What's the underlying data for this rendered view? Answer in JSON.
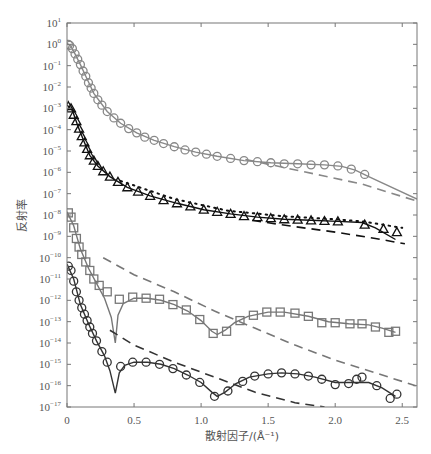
{
  "chart_data": {
    "type": "scatter",
    "title": "",
    "xlabel": "散射因子/(Å⁻¹)",
    "ylabel": "反射率",
    "xlim": [
      0,
      2.61
    ],
    "ylim_log10": [
      -17,
      1
    ],
    "yscale": "log",
    "grid": false,
    "legend": null,
    "x_ticks": [
      0,
      0.5,
      1.0,
      1.5,
      2.0,
      2.5
    ],
    "x_tick_labels": [
      "0",
      "0.5",
      "1.0",
      "1.5",
      "2.0",
      "2.5"
    ],
    "y_ticks_log10": [
      1,
      0,
      -1,
      -2,
      -3,
      -4,
      -5,
      -6,
      -7,
      -8,
      -9,
      -10,
      -11,
      -12,
      -13,
      -14,
      -15,
      -16,
      -17
    ],
    "series": [
      {
        "name": "gray-circles-top",
        "marker": "circle",
        "color": "#888888",
        "points_log10": [
          [
            0.01,
            0.0
          ],
          [
            0.02,
            -0.05
          ],
          [
            0.04,
            -0.2
          ],
          [
            0.06,
            -0.45
          ],
          [
            0.08,
            -0.7
          ],
          [
            0.1,
            -0.95
          ],
          [
            0.12,
            -1.25
          ],
          [
            0.14,
            -1.5
          ],
          [
            0.16,
            -1.8
          ],
          [
            0.18,
            -2.05
          ],
          [
            0.2,
            -2.3
          ],
          [
            0.23,
            -2.6
          ],
          [
            0.26,
            -2.85
          ],
          [
            0.3,
            -3.15
          ],
          [
            0.35,
            -3.45
          ],
          [
            0.4,
            -3.7
          ],
          [
            0.46,
            -3.95
          ],
          [
            0.52,
            -4.15
          ],
          [
            0.58,
            -4.35
          ],
          [
            0.65,
            -4.5
          ],
          [
            0.72,
            -4.65
          ],
          [
            0.8,
            -4.8
          ],
          [
            0.88,
            -4.95
          ],
          [
            0.96,
            -5.05
          ],
          [
            1.04,
            -5.15
          ],
          [
            1.12,
            -5.25
          ],
          [
            1.22,
            -5.35
          ],
          [
            1.32,
            -5.45
          ],
          [
            1.42,
            -5.5
          ],
          [
            1.52,
            -5.55
          ],
          [
            1.62,
            -5.6
          ],
          [
            1.72,
            -5.6
          ],
          [
            1.82,
            -5.65
          ],
          [
            1.92,
            -5.65
          ],
          [
            2.02,
            -5.7
          ],
          [
            2.12,
            -5.85
          ],
          [
            2.22,
            -6.1
          ]
        ],
        "fit_log10": [
          [
            0.0,
            0.05
          ],
          [
            0.03,
            -0.1
          ],
          [
            0.06,
            -0.45
          ],
          [
            0.1,
            -0.95
          ],
          [
            0.14,
            -1.5
          ],
          [
            0.2,
            -2.3
          ],
          [
            0.3,
            -3.15
          ],
          [
            0.4,
            -3.7
          ],
          [
            0.52,
            -4.15
          ],
          [
            0.65,
            -4.5
          ],
          [
            0.8,
            -4.8
          ],
          [
            0.96,
            -5.05
          ],
          [
            1.12,
            -5.25
          ],
          [
            1.32,
            -5.45
          ],
          [
            1.52,
            -5.55
          ],
          [
            1.72,
            -5.6
          ],
          [
            1.92,
            -5.65
          ],
          [
            2.05,
            -5.72
          ],
          [
            2.15,
            -5.9
          ],
          [
            2.25,
            -6.2
          ],
          [
            2.61,
            -7.25
          ]
        ],
        "dashed_log10": [
          [
            1.33,
            -5.4
          ],
          [
            1.6,
            -5.75
          ],
          [
            1.9,
            -6.15
          ],
          [
            2.2,
            -6.55
          ],
          [
            2.61,
            -7.35
          ]
        ]
      },
      {
        "name": "black-triangles",
        "marker": "triangle",
        "color": "#111111",
        "points_log10": [
          [
            0.01,
            -2.9
          ],
          [
            0.03,
            -3.0
          ],
          [
            0.05,
            -3.3
          ],
          [
            0.07,
            -3.6
          ],
          [
            0.09,
            -3.95
          ],
          [
            0.11,
            -4.3
          ],
          [
            0.13,
            -4.6
          ],
          [
            0.15,
            -4.9
          ],
          [
            0.17,
            -5.2
          ],
          [
            0.2,
            -5.45
          ],
          [
            0.23,
            -5.7
          ],
          [
            0.27,
            -5.95
          ],
          [
            0.32,
            -6.2
          ],
          [
            0.38,
            -6.45
          ],
          [
            0.45,
            -6.7
          ],
          [
            0.53,
            -6.9
          ],
          [
            0.62,
            -7.1
          ],
          [
            0.72,
            -7.3
          ],
          [
            0.82,
            -7.45
          ],
          [
            0.92,
            -7.6
          ],
          [
            1.02,
            -7.75
          ],
          [
            1.12,
            -7.85
          ],
          [
            1.22,
            -7.95
          ],
          [
            1.32,
            -8.05
          ],
          [
            1.42,
            -8.1
          ],
          [
            1.52,
            -8.15
          ],
          [
            1.62,
            -8.2
          ],
          [
            1.72,
            -8.22
          ],
          [
            1.82,
            -8.25
          ],
          [
            1.92,
            -8.28
          ],
          [
            2.02,
            -8.3
          ],
          [
            2.22,
            -8.45
          ],
          [
            2.36,
            -8.65
          ],
          [
            2.46,
            -8.8
          ]
        ],
        "fit_log10": [
          [
            0.0,
            -2.85
          ],
          [
            0.04,
            -3.1
          ],
          [
            0.08,
            -3.8
          ],
          [
            0.12,
            -4.45
          ],
          [
            0.17,
            -5.2
          ],
          [
            0.23,
            -5.7
          ],
          [
            0.32,
            -6.2
          ],
          [
            0.45,
            -6.7
          ],
          [
            0.62,
            -7.1
          ],
          [
            0.82,
            -7.45
          ],
          [
            1.02,
            -7.75
          ],
          [
            1.22,
            -7.95
          ],
          [
            1.42,
            -8.1
          ],
          [
            1.62,
            -8.2
          ],
          [
            1.82,
            -8.25
          ],
          [
            2.02,
            -8.3
          ],
          [
            2.2,
            -8.35
          ],
          [
            2.3,
            -8.6
          ],
          [
            2.45,
            -9.15
          ]
        ],
        "dotted_log10": [
          [
            0.4,
            -6.4
          ],
          [
            0.8,
            -7.25
          ],
          [
            1.2,
            -7.8
          ],
          [
            1.6,
            -8.05
          ],
          [
            2.0,
            -8.2
          ],
          [
            2.2,
            -8.3
          ],
          [
            2.35,
            -8.45
          ],
          [
            2.5,
            -8.6
          ]
        ],
        "dashed_log10": [
          [
            1.38,
            -8.25
          ],
          [
            1.7,
            -8.55
          ],
          [
            2.0,
            -8.8
          ],
          [
            2.3,
            -9.1
          ],
          [
            2.52,
            -9.35
          ]
        ]
      },
      {
        "name": "gray-squares",
        "marker": "square",
        "color": "#777777",
        "points_log10": [
          [
            0.01,
            -7.9
          ],
          [
            0.03,
            -8.1
          ],
          [
            0.05,
            -8.6
          ],
          [
            0.07,
            -9.1
          ],
          [
            0.09,
            -9.5
          ],
          [
            0.11,
            -9.85
          ],
          [
            0.14,
            -10.2
          ],
          [
            0.17,
            -10.6
          ],
          [
            0.2,
            -11.0
          ],
          [
            0.24,
            -11.3
          ],
          [
            0.3,
            -11.6
          ],
          [
            0.39,
            -11.95
          ],
          [
            0.49,
            -11.85
          ],
          [
            0.59,
            -11.9
          ],
          [
            0.69,
            -11.95
          ],
          [
            0.79,
            -12.2
          ],
          [
            0.89,
            -12.45
          ],
          [
            0.99,
            -12.9
          ],
          [
            1.09,
            -13.55
          ],
          [
            1.19,
            -13.45
          ],
          [
            1.29,
            -12.95
          ],
          [
            1.39,
            -12.7
          ],
          [
            1.49,
            -12.55
          ],
          [
            1.59,
            -12.55
          ],
          [
            1.7,
            -12.6
          ],
          [
            1.8,
            -12.75
          ],
          [
            1.9,
            -13.05
          ],
          [
            2.0,
            -13.05
          ],
          [
            2.11,
            -13.1
          ],
          [
            2.2,
            -13.1
          ],
          [
            2.3,
            -13.25
          ],
          [
            2.4,
            -13.5
          ],
          [
            2.45,
            -13.45
          ]
        ],
        "fit_log10": [
          [
            0.0,
            -7.85
          ],
          [
            0.05,
            -8.5
          ],
          [
            0.1,
            -9.6
          ],
          [
            0.16,
            -10.5
          ],
          [
            0.22,
            -11.2
          ],
          [
            0.28,
            -11.9
          ],
          [
            0.33,
            -12.8
          ],
          [
            0.36,
            -14.0
          ],
          [
            0.38,
            -12.7
          ],
          [
            0.42,
            -12.15
          ],
          [
            0.5,
            -11.9
          ],
          [
            0.6,
            -11.9
          ],
          [
            0.7,
            -12.0
          ],
          [
            0.8,
            -12.2
          ],
          [
            0.9,
            -12.5
          ],
          [
            1.0,
            -12.95
          ],
          [
            1.08,
            -13.45
          ],
          [
            1.12,
            -13.6
          ],
          [
            1.18,
            -13.4
          ],
          [
            1.25,
            -13.05
          ],
          [
            1.35,
            -12.75
          ],
          [
            1.5,
            -12.55
          ],
          [
            1.62,
            -12.55
          ],
          [
            1.8,
            -12.75
          ],
          [
            1.95,
            -13.0
          ],
          [
            2.1,
            -13.1
          ],
          [
            2.25,
            -13.15
          ],
          [
            2.35,
            -13.3
          ],
          [
            2.45,
            -13.5
          ]
        ],
        "dashed_log10": [
          [
            0.27,
            -10.0
          ],
          [
            0.5,
            -10.8
          ],
          [
            0.8,
            -11.6
          ],
          [
            1.1,
            -12.5
          ],
          [
            1.4,
            -13.3
          ],
          [
            1.7,
            -14.1
          ],
          [
            2.0,
            -14.8
          ],
          [
            2.3,
            -15.4
          ],
          [
            2.6,
            -16.0
          ]
        ]
      },
      {
        "name": "black-circles-bottom",
        "marker": "circle",
        "color": "#333333",
        "points_log10": [
          [
            0.01,
            -10.4
          ],
          [
            0.03,
            -10.6
          ],
          [
            0.05,
            -11.1
          ],
          [
            0.07,
            -11.6
          ],
          [
            0.09,
            -12.0
          ],
          [
            0.11,
            -12.35
          ],
          [
            0.13,
            -12.65
          ],
          [
            0.15,
            -12.95
          ],
          [
            0.17,
            -13.25
          ],
          [
            0.19,
            -13.55
          ],
          [
            0.22,
            -13.9
          ],
          [
            0.26,
            -14.4
          ],
          [
            0.3,
            -14.9
          ],
          [
            0.4,
            -15.1
          ],
          [
            0.49,
            -14.9
          ],
          [
            0.59,
            -14.9
          ],
          [
            0.69,
            -15.0
          ],
          [
            0.79,
            -15.2
          ],
          [
            0.89,
            -15.5
          ],
          [
            0.99,
            -15.85
          ],
          [
            1.1,
            -16.5
          ],
          [
            1.2,
            -16.25
          ],
          [
            1.31,
            -15.8
          ],
          [
            1.4,
            -15.55
          ],
          [
            1.5,
            -15.45
          ],
          [
            1.6,
            -15.4
          ],
          [
            1.7,
            -15.45
          ],
          [
            1.8,
            -15.55
          ],
          [
            1.9,
            -15.7
          ],
          [
            2.0,
            -15.95
          ],
          [
            2.1,
            -15.9
          ],
          [
            2.16,
            -15.7
          ],
          [
            2.2,
            -15.6
          ],
          [
            2.31,
            -16.0
          ],
          [
            2.41,
            -16.6
          ],
          [
            2.46,
            -16.4
          ]
        ],
        "fit_log10": [
          [
            0.0,
            -10.3
          ],
          [
            0.05,
            -11.0
          ],
          [
            0.1,
            -12.2
          ],
          [
            0.16,
            -13.1
          ],
          [
            0.22,
            -13.9
          ],
          [
            0.28,
            -14.6
          ],
          [
            0.32,
            -15.3
          ],
          [
            0.36,
            -16.35
          ],
          [
            0.39,
            -15.4
          ],
          [
            0.43,
            -15.05
          ],
          [
            0.5,
            -14.9
          ],
          [
            0.6,
            -14.9
          ],
          [
            0.7,
            -15.0
          ],
          [
            0.8,
            -15.2
          ],
          [
            0.9,
            -15.5
          ],
          [
            1.0,
            -15.85
          ],
          [
            1.08,
            -16.3
          ],
          [
            1.12,
            -16.5
          ],
          [
            1.18,
            -16.3
          ],
          [
            1.26,
            -15.9
          ],
          [
            1.36,
            -15.6
          ],
          [
            1.5,
            -15.45
          ],
          [
            1.6,
            -15.4
          ],
          [
            1.72,
            -15.45
          ],
          [
            1.85,
            -15.6
          ],
          [
            2.0,
            -15.85
          ],
          [
            2.12,
            -15.85
          ],
          [
            2.25,
            -15.85
          ],
          [
            2.35,
            -16.1
          ],
          [
            2.45,
            -16.5
          ]
        ],
        "dashed_log10": [
          [
            0.32,
            -13.4
          ],
          [
            0.5,
            -14.1
          ],
          [
            0.8,
            -14.9
          ],
          [
            1.1,
            -15.6
          ],
          [
            1.4,
            -16.3
          ],
          [
            1.7,
            -16.8
          ],
          [
            1.92,
            -17.0
          ]
        ]
      }
    ]
  }
}
